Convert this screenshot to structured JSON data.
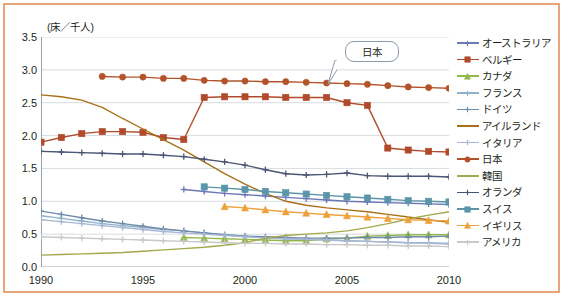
{
  "chart_data": {
    "type": "line",
    "title": "",
    "unit_label": "(床／千人)",
    "xlabel": "",
    "ylabel": "",
    "xlim": [
      1990,
      2010
    ],
    "ylim": [
      0.0,
      3.5
    ],
    "xticks": [
      1990,
      1995,
      2000,
      2005,
      2010
    ],
    "yticks": [
      "0.0",
      "0.5",
      "1.0",
      "1.5",
      "2.0",
      "2.5",
      "3.0",
      "3.5"
    ],
    "grid": "horizontal",
    "legend_position": "right",
    "annotations": [
      {
        "text": "日本",
        "target_year": 2004,
        "target_value": 2.78
      }
    ],
    "x": [
      1990,
      1991,
      1992,
      1993,
      1994,
      1995,
      1996,
      1997,
      1998,
      1999,
      2000,
      2001,
      2002,
      2003,
      2004,
      2005,
      2006,
      2007,
      2008,
      2009,
      2010
    ],
    "series": [
      {
        "name": "オーストラリア",
        "color": "#6b79b5",
        "marker": "cross",
        "values": [
          null,
          null,
          null,
          null,
          null,
          null,
          null,
          1.18,
          1.15,
          1.12,
          1.1,
          1.08,
          1.06,
          1.04,
          1.02,
          1.0,
          0.99,
          0.98,
          0.97,
          0.96,
          0.95
        ]
      },
      {
        "name": "ベルギー",
        "color": "#b04a2a",
        "marker": "square",
        "values": [
          1.9,
          1.97,
          2.03,
          2.06,
          2.06,
          2.05,
          1.97,
          1.94,
          2.58,
          2.59,
          2.59,
          2.59,
          2.58,
          2.58,
          2.58,
          2.5,
          2.46,
          1.81,
          1.78,
          1.76,
          1.75
        ]
      },
      {
        "name": "カナダ",
        "color": "#93b84c",
        "marker": "triangle",
        "values": [
          null,
          null,
          null,
          null,
          null,
          null,
          null,
          0.45,
          0.44,
          0.43,
          0.42,
          0.41,
          0.4,
          0.4,
          0.43,
          0.44,
          0.47,
          0.48,
          0.49,
          0.49,
          0.49
        ]
      },
      {
        "name": "フランス",
        "color": "#8fb3c9",
        "marker": "cross",
        "values": [
          0.78,
          0.74,
          0.7,
          0.66,
          0.63,
          0.6,
          0.57,
          0.55,
          0.52,
          0.49,
          0.47,
          0.45,
          0.43,
          0.42,
          0.41,
          0.4,
          0.39,
          0.38,
          0.37,
          0.37,
          0.36
        ]
      },
      {
        "name": "ドイツ",
        "color": "#6f8aa8",
        "marker": "cross",
        "values": [
          0.85,
          0.8,
          0.75,
          0.7,
          0.66,
          0.62,
          0.58,
          0.55,
          0.52,
          0.49,
          0.47,
          0.46,
          0.45,
          0.44,
          0.44,
          0.44,
          0.45,
          0.45,
          0.46,
          0.46,
          0.47
        ]
      },
      {
        "name": "アイルランド",
        "color": "#a97018",
        "marker": "none",
        "values": [
          2.62,
          2.59,
          2.54,
          2.43,
          2.26,
          2.1,
          1.94,
          1.78,
          1.6,
          1.42,
          1.26,
          1.12,
          1.0,
          0.94,
          0.9,
          0.87,
          0.84,
          0.8,
          0.76,
          0.72,
          0.68
        ]
      },
      {
        "name": "イタリア",
        "color": "#a9b7d4",
        "marker": "cross",
        "values": [
          0.72,
          0.69,
          0.66,
          0.63,
          0.6,
          0.57,
          0.54,
          0.52,
          0.5,
          0.48,
          0.46,
          0.44,
          0.43,
          0.42,
          0.41,
          0.4,
          0.39,
          0.38,
          0.37,
          0.36,
          0.35
        ]
      },
      {
        "name": "日本",
        "color": "#b3532a",
        "marker": "circle",
        "values": [
          null,
          null,
          null,
          2.9,
          2.89,
          2.89,
          2.87,
          2.87,
          2.84,
          2.83,
          2.83,
          2.82,
          2.82,
          2.81,
          2.8,
          2.79,
          2.78,
          2.76,
          2.74,
          2.73,
          2.72
        ]
      },
      {
        "name": "韓国",
        "color": "#a3a84a",
        "marker": "none",
        "values": [
          0.18,
          0.19,
          0.2,
          0.21,
          0.22,
          0.24,
          0.26,
          0.28,
          0.3,
          0.33,
          0.37,
          0.44,
          0.48,
          0.5,
          0.52,
          0.55,
          0.6,
          0.66,
          0.73,
          0.79,
          0.84
        ]
      },
      {
        "name": "オランダ",
        "color": "#4b5575",
        "marker": "cross",
        "values": [
          1.76,
          1.75,
          1.74,
          1.73,
          1.72,
          1.72,
          1.7,
          1.68,
          1.64,
          1.6,
          1.55,
          1.48,
          1.42,
          1.4,
          1.41,
          1.43,
          1.39,
          1.38,
          1.38,
          1.38,
          1.37
        ]
      },
      {
        "name": "スイス",
        "color": "#5b95aa",
        "marker": "square",
        "values": [
          null,
          null,
          null,
          null,
          null,
          null,
          null,
          null,
          1.22,
          1.2,
          1.18,
          1.15,
          1.13,
          1.11,
          1.09,
          1.07,
          1.05,
          1.03,
          1.01,
          1.0,
          0.99
        ]
      },
      {
        "name": "イギリス",
        "color": "#eda13a",
        "marker": "triangle",
        "values": [
          null,
          null,
          null,
          null,
          null,
          null,
          null,
          null,
          null,
          0.92,
          0.9,
          0.87,
          0.84,
          0.82,
          0.8,
          0.78,
          0.76,
          0.74,
          0.72,
          0.71,
          0.7
        ]
      },
      {
        "name": "アメリカ",
        "color": "#c8c8c8",
        "marker": "cross",
        "values": [
          0.46,
          0.45,
          0.44,
          0.43,
          0.42,
          0.41,
          0.4,
          0.39,
          0.38,
          0.37,
          0.36,
          0.36,
          0.35,
          0.35,
          0.34,
          0.34,
          0.33,
          0.33,
          0.32,
          0.32,
          0.31
        ]
      }
    ]
  },
  "theme": {
    "border_color": "#e8a579",
    "grid_color": "#d8dce0",
    "axis_color": "#9aa0a6",
    "text_color": "#231f20",
    "callout_border": "#8d99ae"
  }
}
